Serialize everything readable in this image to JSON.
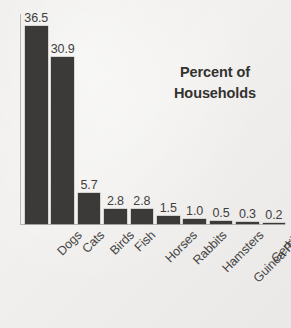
{
  "chart_data": {
    "type": "bar",
    "title": "Percent of Households",
    "title_line1": "Percent of",
    "title_line2": "Households",
    "xlabel": "",
    "ylabel": "",
    "ylim": [
      0,
      38.8
    ],
    "grid": false,
    "legend": "none",
    "orientation": "vertical",
    "value_labels_shown": true,
    "categories": [
      "Dogs",
      "Cats",
      "Birds",
      "Fish",
      "Horses",
      "Rabbits",
      "Hamsters",
      "Guinea Pigs",
      "Gerbils",
      "Ferrets"
    ],
    "values": [
      36.5,
      30.9,
      5.7,
      2.8,
      2.8,
      1.5,
      1.0,
      0.5,
      0.3,
      0.2
    ],
    "value_labels": [
      "36.5",
      "30.9",
      "5.7",
      "2.8",
      "2.8",
      "1.5",
      "1.0",
      "0.5",
      "0.3",
      "0.2"
    ]
  },
  "colors": {
    "background": "#f1f0ee",
    "bar_fill": "#3b3a39",
    "axis_line": "#b9b7b4",
    "value_text": "#3f3e3d",
    "category_text": "#464544",
    "title_text": "#33322f"
  }
}
